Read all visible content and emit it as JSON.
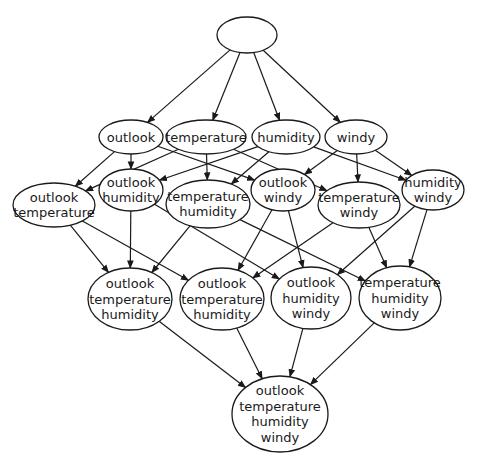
{
  "diagram": {
    "type": "attribute-lattice",
    "colors": {
      "stroke": "#1a1a1a",
      "fill": "#ffffff",
      "background": "#ffffff"
    },
    "nodes": [
      {
        "id": "root",
        "lines": [],
        "cx": 247,
        "cy": 35,
        "rx": 30,
        "ry": 18
      },
      {
        "id": "o",
        "lines": [
          "outlook"
        ],
        "cx": 131,
        "cy": 137,
        "rx": 32,
        "ry": 17
      },
      {
        "id": "t",
        "lines": [
          "temperature"
        ],
        "cx": 206,
        "cy": 137,
        "rx": 40,
        "ry": 17
      },
      {
        "id": "h",
        "lines": [
          "humidity"
        ],
        "cx": 286,
        "cy": 137,
        "rx": 34,
        "ry": 17
      },
      {
        "id": "w",
        "lines": [
          "windy"
        ],
        "cx": 356,
        "cy": 137,
        "rx": 31,
        "ry": 17
      },
      {
        "id": "ot",
        "lines": [
          "outlook",
          "temperature"
        ],
        "cx": 54,
        "cy": 205,
        "rx": 41,
        "ry": 22
      },
      {
        "id": "oh",
        "lines": [
          "outlook",
          "humidity"
        ],
        "cx": 131,
        "cy": 190,
        "rx": 32,
        "ry": 21
      },
      {
        "id": "th",
        "lines": [
          "temperature",
          "humidity"
        ],
        "cx": 208,
        "cy": 204,
        "rx": 42,
        "ry": 24
      },
      {
        "id": "ow",
        "lines": [
          "outlook",
          "windy"
        ],
        "cx": 283,
        "cy": 190,
        "rx": 32,
        "ry": 21
      },
      {
        "id": "tw",
        "lines": [
          "temperature",
          "windy"
        ],
        "cx": 359,
        "cy": 205,
        "rx": 41,
        "ry": 23
      },
      {
        "id": "hw",
        "lines": [
          "humidity",
          "windy"
        ],
        "cx": 433,
        "cy": 190,
        "rx": 31,
        "ry": 20
      },
      {
        "id": "oth",
        "lines": [
          "outlook",
          "temperature",
          "humidity"
        ],
        "cx": 130,
        "cy": 299,
        "rx": 42,
        "ry": 31
      },
      {
        "id": "otw",
        "lines": [
          "outlook",
          "temperature",
          "humidity"
        ],
        "cx": 222,
        "cy": 299,
        "rx": 42,
        "ry": 31
      },
      {
        "id": "ohw",
        "lines": [
          "outlook",
          "humidity",
          "windy"
        ],
        "cx": 311,
        "cy": 298,
        "rx": 40,
        "ry": 31
      },
      {
        "id": "thw",
        "lines": [
          "temperature",
          "humidity",
          "windy"
        ],
        "cx": 400,
        "cy": 298,
        "rx": 41,
        "ry": 32
      },
      {
        "id": "othw",
        "lines": [
          "outlook",
          "temperature",
          "humidity",
          "windy"
        ],
        "cx": 280,
        "cy": 414,
        "rx": 48,
        "ry": 38
      }
    ],
    "edges": [
      [
        "root",
        "o"
      ],
      [
        "root",
        "t"
      ],
      [
        "root",
        "h"
      ],
      [
        "root",
        "w"
      ],
      [
        "o",
        "ot"
      ],
      [
        "o",
        "oh"
      ],
      [
        "o",
        "ow"
      ],
      [
        "t",
        "ot"
      ],
      [
        "t",
        "th"
      ],
      [
        "t",
        "tw"
      ],
      [
        "h",
        "oh"
      ],
      [
        "h",
        "th"
      ],
      [
        "h",
        "hw"
      ],
      [
        "w",
        "ow"
      ],
      [
        "w",
        "tw"
      ],
      [
        "w",
        "hw"
      ],
      [
        "ot",
        "oth"
      ],
      [
        "ot",
        "otw"
      ],
      [
        "oh",
        "oth"
      ],
      [
        "oh",
        "ohw"
      ],
      [
        "th",
        "oth"
      ],
      [
        "th",
        "thw"
      ],
      [
        "ow",
        "otw"
      ],
      [
        "ow",
        "ohw"
      ],
      [
        "tw",
        "otw"
      ],
      [
        "tw",
        "thw"
      ],
      [
        "hw",
        "ohw"
      ],
      [
        "hw",
        "thw"
      ],
      [
        "oth",
        "othw"
      ],
      [
        "otw",
        "othw"
      ],
      [
        "ohw",
        "othw"
      ],
      [
        "thw",
        "othw"
      ]
    ]
  }
}
